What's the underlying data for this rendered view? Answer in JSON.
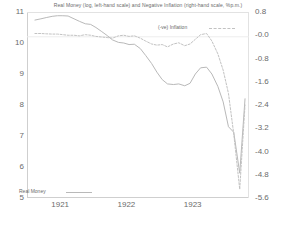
{
  "chart_data": {
    "type": "line",
    "title": "Real Money (log, left-hand scale) and Negative Inflation (right-hand scale, %p.m.)",
    "xlabel": "",
    "ylabel": "",
    "y2label": "",
    "grid": false,
    "legend_position": "inside",
    "xlim": [
      1920.5,
      1923.85
    ],
    "ylim": [
      5,
      11
    ],
    "y2lim": [
      -5.6,
      0.8
    ],
    "xticks": [
      1921,
      1922,
      1923
    ],
    "xticklabels": [
      "1921",
      "1922",
      "1923"
    ],
    "yticks": [
      5,
      6,
      7,
      8,
      9,
      10,
      11
    ],
    "yticklabels": [
      "5",
      "6",
      "7",
      "8",
      "9",
      "10",
      "11"
    ],
    "y2ticks": [
      0.8,
      -0.0,
      -0.8,
      -1.6,
      -2.4,
      -3.2,
      -4.0,
      -4.8,
      -5.6
    ],
    "y2ticklabels": [
      "0.8",
      "-0.0",
      "-0.8",
      "-1.6",
      "-2.4",
      "-3.2",
      "-4.0",
      "-4.8",
      "-5.6"
    ],
    "series": [
      {
        "name": "Real Money",
        "axis": "left",
        "style": "solid",
        "color": "#b9b9b9",
        "x": [
          1920.62,
          1920.71,
          1920.79,
          1920.88,
          1920.96,
          1921.04,
          1921.12,
          1921.21,
          1921.29,
          1921.38,
          1921.46,
          1921.54,
          1921.62,
          1921.71,
          1921.79,
          1921.88,
          1921.96,
          1922.04,
          1922.12,
          1922.21,
          1922.29,
          1922.38,
          1922.46,
          1922.54,
          1922.62,
          1922.71,
          1922.79,
          1922.88,
          1922.96,
          1923.04,
          1923.12,
          1923.21,
          1923.29,
          1923.38,
          1923.46,
          1923.54,
          1923.62,
          1923.71,
          1923.79
        ],
        "y": [
          10.74,
          10.78,
          10.82,
          10.86,
          10.88,
          10.88,
          10.87,
          10.78,
          10.7,
          10.62,
          10.6,
          10.5,
          10.38,
          10.24,
          10.1,
          10.02,
          10.0,
          9.95,
          9.96,
          9.82,
          9.6,
          9.34,
          9.06,
          8.82,
          8.68,
          8.66,
          8.68,
          8.62,
          8.7,
          9.0,
          9.2,
          9.22,
          9.0,
          8.6,
          8.1,
          7.3,
          7.12,
          5.8,
          8.2
        ]
      },
      {
        "name": "(-ve) Inflation",
        "axis": "right",
        "style": "dashed",
        "color": "#c2c2c2",
        "x": [
          1920.62,
          1920.71,
          1920.79,
          1920.88,
          1920.96,
          1921.04,
          1921.12,
          1921.21,
          1921.29,
          1921.38,
          1921.46,
          1921.54,
          1921.62,
          1921.71,
          1921.79,
          1921.88,
          1921.96,
          1922.04,
          1922.12,
          1922.21,
          1922.29,
          1922.38,
          1922.46,
          1922.54,
          1922.62,
          1922.71,
          1922.79,
          1922.88,
          1922.96,
          1923.04,
          1923.12,
          1923.21,
          1923.29,
          1923.38,
          1923.46,
          1923.54,
          1923.62,
          1923.71,
          1923.79
        ],
        "y": [
          0.06,
          0.06,
          0.05,
          0.04,
          0.04,
          0.02,
          0.0,
          0.0,
          -0.02,
          0.02,
          0.0,
          -0.04,
          -0.06,
          -0.08,
          -0.1,
          -0.02,
          0.0,
          -0.04,
          -0.02,
          -0.1,
          -0.2,
          -0.3,
          -0.34,
          -0.32,
          -0.4,
          -0.3,
          -0.26,
          -0.36,
          -0.3,
          -0.14,
          0.02,
          0.06,
          -0.2,
          -0.64,
          -1.2,
          -2.0,
          -3.4,
          -5.3,
          -2.4
        ]
      }
    ],
    "annotations": []
  },
  "legend": {
    "inflation": {
      "label": "(-ve) Inflation",
      "style": "dashed"
    },
    "real_money": {
      "label": "Real Money",
      "style": "solid"
    }
  },
  "footer": {
    "partial_text": ""
  }
}
